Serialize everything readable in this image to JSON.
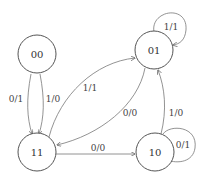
{
  "diagram": {
    "type": "state-machine",
    "states": [
      {
        "id": "00",
        "label": "00"
      },
      {
        "id": "01",
        "label": "01"
      },
      {
        "id": "11",
        "label": "11"
      },
      {
        "id": "10",
        "label": "10"
      }
    ],
    "transitions": [
      {
        "from": "00",
        "to": "11",
        "label": "0/1"
      },
      {
        "from": "00",
        "to": "11",
        "label": "1/0"
      },
      {
        "from": "11",
        "to": "01",
        "label": "1/1"
      },
      {
        "from": "01",
        "to": "11",
        "label": "0/0"
      },
      {
        "from": "11",
        "to": "10",
        "label": "0/0"
      },
      {
        "from": "10",
        "to": "01",
        "label": "1/0"
      },
      {
        "from": "01",
        "to": "01",
        "label": "1/1"
      },
      {
        "from": "10",
        "to": "10",
        "label": "0/1"
      }
    ]
  }
}
